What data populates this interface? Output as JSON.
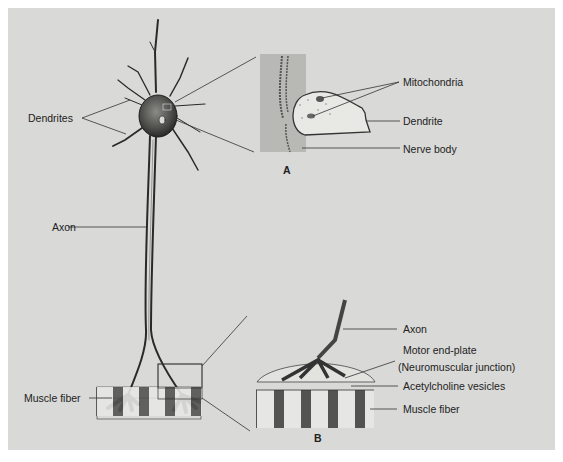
{
  "figure": {
    "main_neuron": {
      "labels": {
        "dendrites": "Dendrites",
        "axon": "Axon",
        "muscle_fiber": "Muscle fiber"
      }
    },
    "inset_a": {
      "letter": "A",
      "labels": {
        "mitochondria": "Mitochondria",
        "dendrite": "Dendrite",
        "nerve_body": "Nerve body"
      }
    },
    "inset_b": {
      "letter": "B",
      "labels": {
        "axon": "Axon",
        "motor_end_plate": "Motor end-plate",
        "neuromuscular_junction": "(Neuromuscular junction)",
        "acetylcholine_vesicles": "Acetylcholine vesicles",
        "muscle_fiber": "Muscle fiber"
      }
    },
    "colors": {
      "panel_background": "#d9d9d7",
      "ink": "#222222"
    }
  }
}
